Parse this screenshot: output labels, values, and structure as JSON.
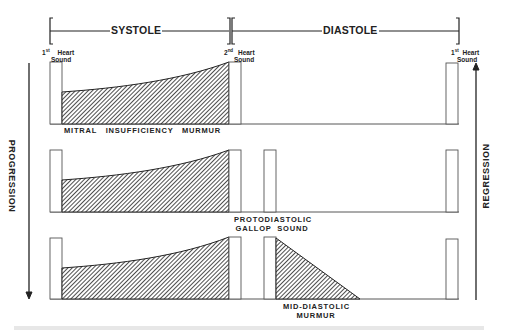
{
  "header": {
    "systole_label": "SYSTOLE",
    "diastole_label": "DIASTOLE"
  },
  "heart_sounds": {
    "first_left": {
      "ordinal": "1",
      "suffix": "st",
      "line1": "Heart",
      "line2": "Sound"
    },
    "second": {
      "ordinal": "2",
      "suffix": "nd",
      "line1": "Heart",
      "line2": "Sound"
    },
    "first_right": {
      "ordinal": "1",
      "suffix": "st",
      "line1": "Heart",
      "line2": "Sound"
    }
  },
  "rows": [
    {
      "caption": "MITRAL   INSUFFICIENCY   MURMUR"
    },
    {
      "caption_line1": "PROTODIASTOLIC",
      "caption_line2": "GALLOP  SOUND"
    },
    {
      "caption_line1": "MID-DIASTOLIC",
      "caption_line2": "MURMUR"
    }
  ],
  "side_arrows": {
    "left": "PROGRESSION",
    "right": "REGRESSION"
  },
  "colors": {
    "ink": "#222222",
    "outline": "#555555",
    "background": "#ffffff"
  }
}
